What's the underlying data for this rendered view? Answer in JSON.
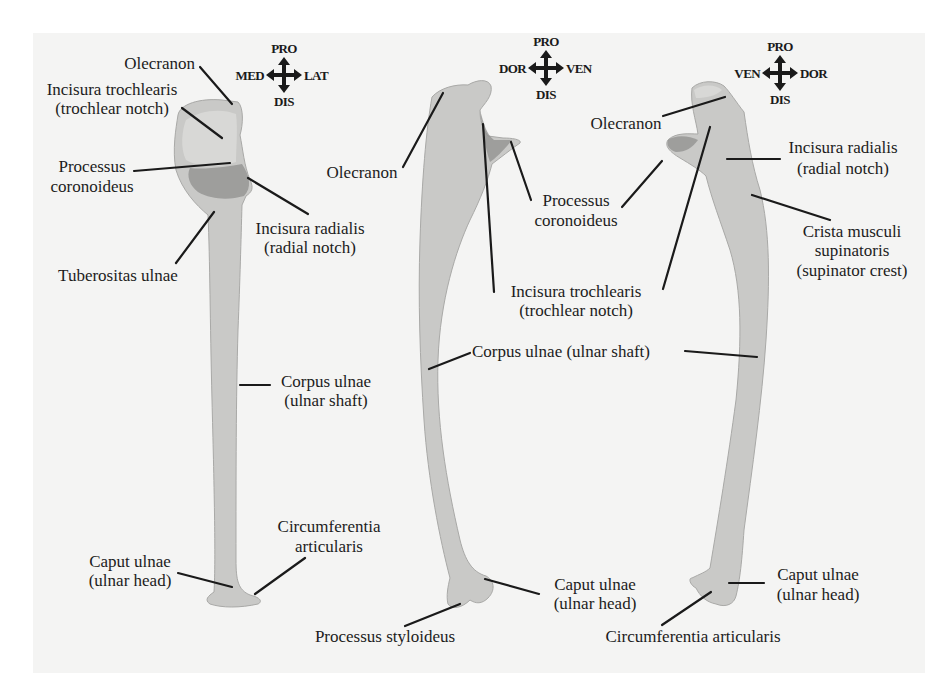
{
  "figure": {
    "colors": {
      "background": "#ffffff",
      "panel": "#f4f4f3",
      "bone": "#c9c9c7",
      "bone_shadow": "#8f8f8d",
      "text": "#1c1c1c"
    },
    "views": [
      {
        "id": "left",
        "compass": {
          "up": "PRO",
          "down": "DIS",
          "left": "MED",
          "right": "LAT"
        },
        "labels": [
          {
            "lines": [
              "Olecranon"
            ]
          },
          {
            "lines": [
              "Incisura trochlearis",
              "(trochlear notch)"
            ]
          },
          {
            "lines": [
              "Processus",
              "coronoideus"
            ]
          },
          {
            "lines": [
              "Incisura radialis",
              "(radial notch)"
            ]
          },
          {
            "lines": [
              "Tuberositas ulnae"
            ]
          },
          {
            "lines": [
              "Corpus ulnae",
              "(ulnar shaft)"
            ]
          },
          {
            "lines": [
              "Circumferentia",
              "articularis"
            ]
          },
          {
            "lines": [
              "Caput ulnae",
              "(ulnar head)"
            ]
          }
        ]
      },
      {
        "id": "middle",
        "compass": {
          "up": "PRO",
          "down": "DIS",
          "left": "DOR",
          "right": "VEN"
        },
        "labels": [
          {
            "lines": [
              "Olecranon"
            ]
          },
          {
            "lines": [
              "Processus",
              "coronoideus"
            ]
          },
          {
            "lines": [
              "Incisura trochlearis",
              "(trochlear notch)"
            ]
          },
          {
            "lines": [
              "Corpus ulnae (ulnar shaft)"
            ]
          },
          {
            "lines": [
              "Caput ulnae",
              "(ulnar head)"
            ]
          },
          {
            "lines": [
              "Processus styloideus"
            ]
          }
        ]
      },
      {
        "id": "right",
        "compass": {
          "up": "PRO",
          "down": "DIS",
          "left": "VEN",
          "right": "DOR"
        },
        "labels": [
          {
            "lines": [
              "Olecranon"
            ]
          },
          {
            "lines": [
              "Incisura radialis",
              "(radial notch)"
            ]
          },
          {
            "lines": [
              "Crista musculi",
              "supinatoris",
              "(supinator crest)"
            ]
          },
          {
            "lines": [
              "Caput ulnae",
              "(ulnar head)"
            ]
          },
          {
            "lines": [
              "Circumferentia articularis"
            ]
          }
        ]
      }
    ]
  }
}
